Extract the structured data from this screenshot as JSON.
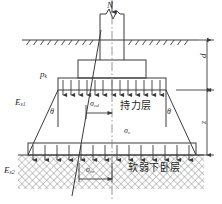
{
  "figure": {
    "line_color": "#3a3a3a",
    "hatch_color": "#7a7a7a",
    "text_color": "#2b2b2b"
  },
  "labels": {
    "axial_load": "N",
    "base_pressure": "p",
    "base_pressure_sub": "k",
    "modulus_top": "E",
    "modulus_top_sub": "s1",
    "modulus_bottom": "E",
    "modulus_bottom_sub": "s2",
    "angle_left": "θ",
    "angle_right": "θ",
    "sigma_cd": "σ",
    "sigma_cd_sub": "cd",
    "sigma_z": "σ",
    "sigma_z_sub": "z",
    "sigma_cz": "σ",
    "sigma_cz_sub": "cz",
    "depth_d": "d",
    "depth_z": "z"
  },
  "strata": {
    "bearing_layer": "持力层",
    "soft_layer": "软弱下卧层"
  },
  "geometry": {
    "ground_line_y": 40,
    "footing_top_y": 60,
    "footing_base_y": 78,
    "soft_layer_y": 155,
    "center_x": 112
  }
}
